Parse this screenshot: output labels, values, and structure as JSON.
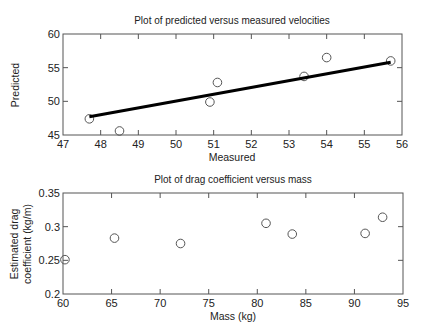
{
  "chart_data": [
    {
      "type": "scatter",
      "title": "Plot of predicted versus measured velocities",
      "xlabel": "Measured",
      "ylabel": "Predicted",
      "xlim": [
        47,
        56
      ],
      "ylim": [
        45,
        60
      ],
      "xticks": [
        47,
        48,
        49,
        50,
        51,
        52,
        53,
        54,
        55,
        56
      ],
      "yticks": [
        45,
        50,
        55,
        60
      ],
      "grid": false,
      "series": [
        {
          "name": "data",
          "marker": "open-circle",
          "x": [
            47.7,
            48.5,
            50.9,
            51.1,
            53.4,
            54.0,
            55.7
          ],
          "y": [
            47.4,
            45.6,
            49.9,
            52.8,
            53.7,
            56.5,
            56.0
          ]
        },
        {
          "name": "fit line",
          "style": "thick-solid-line",
          "x": [
            47.7,
            55.7
          ],
          "y": [
            47.7,
            55.8
          ]
        }
      ]
    },
    {
      "type": "scatter",
      "title": "Plot of drag coefficient versus mass",
      "xlabel": "Mass (kg)",
      "ylabel": "Estimated drag coefficient (kg/m)",
      "ylabel_lines": [
        "Estimated drag",
        "coefficient (kg/m)"
      ],
      "xlim": [
        60,
        95
      ],
      "ylim": [
        0.2,
        0.35
      ],
      "xticks": [
        60,
        65,
        70,
        75,
        80,
        85,
        90,
        95
      ],
      "yticks": [
        0.2,
        0.25,
        0.3,
        0.35
      ],
      "grid": false,
      "series": [
        {
          "name": "data",
          "marker": "open-circle",
          "x": [
            60.2,
            65.3,
            72.1,
            80.9,
            83.6,
            91.1,
            92.9
          ],
          "y": [
            0.251,
            0.283,
            0.275,
            0.305,
            0.289,
            0.29,
            0.314
          ]
        }
      ]
    }
  ],
  "labels": {
    "top_title": "Plot of predicted versus measured velocities",
    "top_xlabel": "Measured",
    "top_ylabel": "Predicted",
    "bottom_title": "Plot of drag coefficient versus mass",
    "bottom_xlabel": "Mass (kg)",
    "bottom_ylabel_1": "Estimated drag",
    "bottom_ylabel_2": "coefficient (kg/m)"
  },
  "colors": {
    "axis": "#555555",
    "marker": "#555555",
    "line": "#000000"
  }
}
